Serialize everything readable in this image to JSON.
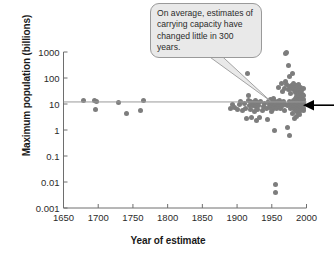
{
  "figure": {
    "callout_text": "On average, estimates of carrying capacity have changed little in 300 years.",
    "arrow_annotation": "current-world-population-marker",
    "dot_color": "#7d7d7d",
    "trendline_color": "#9a9a9a",
    "axis_color": "#6e6e6e",
    "callout_fill": "#e9e9e9",
    "callout_border": "#9a9a9a",
    "arrow_color": "#000000"
  },
  "chart_data": {
    "type": "scatter",
    "title": "",
    "xlabel": "Year of estimate",
    "ylabel": "Maximum population (billions)",
    "xlim": [
      1650,
      2000
    ],
    "ylim": [
      0.001,
      1000
    ],
    "yscale": "log",
    "xticks": [
      1650,
      1700,
      1750,
      1800,
      1850,
      1900,
      1950,
      2000
    ],
    "xtick_labels": [
      "1650",
      "1700",
      "1750",
      "1800",
      "1850",
      "1900",
      "1950",
      "2000"
    ],
    "yticks": [
      1000,
      100,
      10,
      1,
      0.1,
      0.01,
      0.001
    ],
    "ytick_labels": [
      "1000",
      "100",
      "10",
      "1",
      "0.1",
      "0.01",
      "0.001"
    ],
    "grid": false,
    "legend": null,
    "annotations": [
      {
        "name": "carrying-capacity-callout",
        "text": "On average, estimates of carrying capacity have changed little in 300 years.",
        "points_to": {
          "x": 1948,
          "y": 13
        }
      },
      {
        "name": "present-population-arrow",
        "text": "",
        "points_to": {
          "x": 1995,
          "y": 9
        }
      }
    ],
    "trendline": {
      "name": "average-carrying-capacity",
      "x": [
        1650,
        2000
      ],
      "y": [
        12,
        12
      ]
    },
    "series": [
      {
        "name": "Estimates of human carrying capacity",
        "marker": "circle",
        "color": "#7d7d7d",
        "points": [
          [
            1679,
            13.4
          ],
          [
            1694,
            13.4
          ],
          [
            1696,
            6.4
          ],
          [
            1697,
            13.0
          ],
          [
            1729,
            11.5
          ],
          [
            1741,
            4.5
          ],
          [
            1761,
            5.6
          ],
          [
            1765,
            13.2
          ],
          [
            1890,
            6.8
          ],
          [
            1893,
            9.2
          ],
          [
            1897,
            7.4
          ],
          [
            1901,
            6.0
          ],
          [
            1904,
            9.8
          ],
          [
            1905,
            12.0
          ],
          [
            1908,
            5.5
          ],
          [
            1910,
            10.5
          ],
          [
            1912,
            7.0
          ],
          [
            1913,
            2.7
          ],
          [
            1915,
            150.0
          ],
          [
            1916,
            14.0
          ],
          [
            1917,
            22.0
          ],
          [
            1918,
            9.0
          ],
          [
            1919,
            6.0
          ],
          [
            1920,
            12.5
          ],
          [
            1921,
            3.0
          ],
          [
            1922,
            8.5
          ],
          [
            1923,
            11.0
          ],
          [
            1924,
            9.5
          ],
          [
            1925,
            5.2
          ],
          [
            1926,
            13.5
          ],
          [
            1927,
            7.8
          ],
          [
            1928,
            2.4
          ],
          [
            1929,
            11.8
          ],
          [
            1930,
            6.2
          ],
          [
            1931,
            9.0
          ],
          [
            1932,
            3.1
          ],
          [
            1934,
            12.0
          ],
          [
            1936,
            5.8
          ],
          [
            1938,
            8.0
          ],
          [
            1940,
            10.2
          ],
          [
            1942,
            6.5
          ],
          [
            1944,
            2.6
          ],
          [
            1945,
            13.0
          ],
          [
            1946,
            9.4
          ],
          [
            1947,
            7.2
          ],
          [
            1948,
            11.0
          ],
          [
            1948,
            14.5
          ],
          [
            1949,
            5.0
          ],
          [
            1950,
            8.8
          ],
          [
            1950,
            12.5
          ],
          [
            1951,
            10.0
          ],
          [
            1951,
            6.0
          ],
          [
            1952,
            16.0
          ],
          [
            1952,
            9.0
          ],
          [
            1953,
            7.5
          ],
          [
            1953,
            11.5
          ],
          [
            1954,
            1.0
          ],
          [
            1954,
            13.0
          ],
          [
            1955,
            8.2
          ],
          [
            1955,
            0.008
          ],
          [
            1956,
            10.8
          ],
          [
            1956,
            0.004
          ],
          [
            1957,
            6.8
          ],
          [
            1958,
            12.0
          ],
          [
            1959,
            9.6
          ],
          [
            1960,
            45.0
          ],
          [
            1960,
            8.0
          ],
          [
            1961,
            14.0
          ],
          [
            1962,
            11.0
          ],
          [
            1963,
            7.0
          ],
          [
            1964,
            60.0
          ],
          [
            1965,
            9.0
          ],
          [
            1966,
            30.0
          ],
          [
            1967,
            12.5
          ],
          [
            1968,
            5.5
          ],
          [
            1969,
            40.0
          ],
          [
            1970,
            900.0
          ],
          [
            1970,
            75.0
          ],
          [
            1970,
            10.0
          ],
          [
            1971,
            1000.0
          ],
          [
            1971,
            55.0
          ],
          [
            1972,
            8.5
          ],
          [
            1972,
            1.2
          ],
          [
            1973,
            1050.0
          ],
          [
            1974,
            300.0
          ],
          [
            1974,
            35.0
          ],
          [
            1975,
            110.0
          ],
          [
            1975,
            12.0
          ],
          [
            1975,
            0.62
          ],
          [
            1976,
            48.0
          ],
          [
            1976,
            9.2
          ],
          [
            1977,
            25.0
          ],
          [
            1977,
            6.5
          ],
          [
            1978,
            52.0
          ],
          [
            1978,
            11.0
          ],
          [
            1979,
            38.0
          ],
          [
            1979,
            8.0
          ],
          [
            1980,
            150.0
          ],
          [
            1980,
            42.0
          ],
          [
            1980,
            10.5
          ],
          [
            1980,
            4.2
          ],
          [
            1981,
            60.0
          ],
          [
            1981,
            14.0
          ],
          [
            1981,
            7.2
          ],
          [
            1982,
            33.0
          ],
          [
            1982,
            9.8
          ],
          [
            1982,
            2.8
          ],
          [
            1983,
            44.0
          ],
          [
            1983,
            12.0
          ],
          [
            1983,
            6.0
          ],
          [
            1984,
            28.0
          ],
          [
            1984,
            16.0
          ],
          [
            1984,
            8.5
          ],
          [
            1985,
            50.0
          ],
          [
            1985,
            11.5
          ],
          [
            1985,
            5.0
          ],
          [
            1986,
            36.0
          ],
          [
            1986,
            20.0
          ],
          [
            1986,
            9.0
          ],
          [
            1986,
            3.4
          ],
          [
            1987,
            42.0
          ],
          [
            1987,
            13.0
          ],
          [
            1987,
            7.0
          ],
          [
            1988,
            30.0
          ],
          [
            1988,
            17.0
          ],
          [
            1988,
            10.0
          ],
          [
            1988,
            4.8
          ],
          [
            1989,
            55.0
          ],
          [
            1989,
            22.0
          ],
          [
            1989,
            12.5
          ],
          [
            1989,
            6.2
          ],
          [
            1990,
            38.0
          ],
          [
            1990,
            15.0
          ],
          [
            1990,
            9.5
          ],
          [
            1990,
            3.8
          ],
          [
            1991,
            26.0
          ],
          [
            1991,
            11.0
          ],
          [
            1991,
            7.5
          ],
          [
            1992,
            45.0
          ],
          [
            1992,
            14.0
          ],
          [
            1992,
            8.8
          ],
          [
            1992,
            5.4
          ],
          [
            1993,
            32.0
          ],
          [
            1993,
            18.0
          ],
          [
            1993,
            10.8
          ],
          [
            1993,
            6.6
          ],
          [
            1994,
            24.0
          ],
          [
            1994,
            12.2
          ],
          [
            1994,
            8.0
          ],
          [
            1995,
            40.0
          ],
          [
            1995,
            15.5
          ],
          [
            1995,
            9.2
          ],
          [
            1995,
            5.8
          ],
          [
            1996,
            21.0
          ],
          [
            1996,
            11.2
          ],
          [
            1996,
            7.0
          ]
        ]
      }
    ]
  }
}
